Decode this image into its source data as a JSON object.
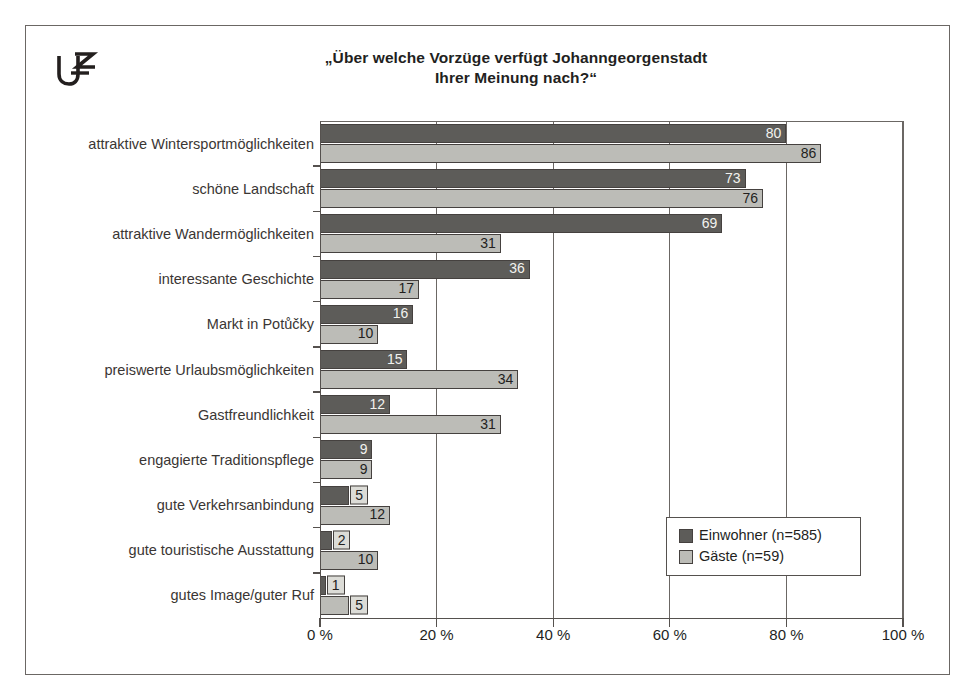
{
  "logo": {
    "text": "UZ",
    "name": "uz-logo"
  },
  "title": {
    "line1": "„Über welche Vorzüge verfügt Johanngeorgenstadt",
    "line2": "Ihrer Meinung nach?“"
  },
  "legend": {
    "entries": [
      {
        "label": "Einwohner (n=585)",
        "color": "#5d5c59"
      },
      {
        "label": "Gäste (n=59)",
        "color": "#bcbcb7"
      }
    ]
  },
  "axis": {
    "ticks": [
      "0 %",
      "20 %",
      "40 %",
      "60 %",
      "80 %",
      "100 %"
    ],
    "tick_values": [
      0,
      20,
      40,
      60,
      80,
      100
    ]
  },
  "chart_data": {
    "type": "bar",
    "orientation": "horizontal",
    "title": "„Über welche Vorzüge verfügt Johanngeorgenstadt Ihrer Meinung nach?“",
    "xlabel": "",
    "ylabel": "",
    "xlim": [
      0,
      100
    ],
    "grid": true,
    "legend_position": "inside-lower-right",
    "categories": [
      "attraktive Wintersportmöglichkeiten",
      "schöne Landschaft",
      "attraktive Wandermöglichkeiten",
      "interessante Geschichte",
      "Markt in Potůčky",
      "preiswerte Urlaubsmöglichkeiten",
      "Gastfreundlichkeit",
      "engagierte Traditionspflege",
      "gute Verkehrsanbindung",
      "gute touristische Ausstattung",
      "gutes Image/guter Ruf"
    ],
    "series": [
      {
        "name": "Einwohner (n=585)",
        "color": "#5d5c59",
        "values": [
          80,
          73,
          69,
          36,
          16,
          15,
          12,
          9,
          5,
          2,
          1
        ]
      },
      {
        "name": "Gäste (n=59)",
        "color": "#bcbcb7",
        "values": [
          86,
          76,
          31,
          17,
          10,
          34,
          31,
          9,
          12,
          10,
          5
        ]
      }
    ],
    "value_labels": {
      "einwohner": [
        "80",
        "73",
        "69",
        "36",
        "16",
        "15",
        "12",
        "9",
        "5",
        "2",
        "1"
      ],
      "gaeste": [
        "86",
        "76",
        "31",
        "17",
        "10",
        "34",
        "31",
        "9",
        "12",
        "10",
        "5"
      ]
    }
  }
}
